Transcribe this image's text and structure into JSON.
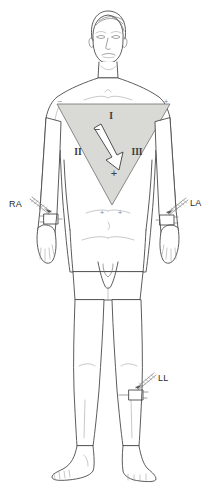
{
  "figure": {
    "background_color": "#ffffff"
  },
  "triangle": {
    "name": "Einthoven triangle",
    "fill_color": "#d9d9d6",
    "stroke_color": "#6e6e6e",
    "vertices": {
      "top_left": [
        57,
        104
      ],
      "top_right": [
        170,
        104
      ],
      "bottom_apex": [
        112,
        205
      ]
    },
    "leads": [
      {
        "id": "lead-i",
        "label": "I",
        "x": 111,
        "y": 116
      },
      {
        "id": "lead-ii",
        "label": "II",
        "x": 78,
        "y": 152
      },
      {
        "id": "lead-iii",
        "label": "III",
        "x": 137,
        "y": 152
      }
    ],
    "polarity_marks": [
      {
        "id": "lead-i-negative",
        "symbol": "−",
        "x": 97,
        "y": 129,
        "prominent": true
      },
      {
        "id": "lead-i-positive",
        "symbol": "+",
        "x": 114,
        "y": 173,
        "prominent": true
      },
      {
        "id": "shoulder-left-minus",
        "symbol": "−",
        "x": 58,
        "y": 103,
        "prominent": false
      },
      {
        "id": "shoulder-right-plus",
        "symbol": "+",
        "x": 166,
        "y": 102,
        "prominent": false
      },
      {
        "id": "apex-plus-left",
        "symbol": "+",
        "x": 102,
        "y": 212,
        "prominent": false
      },
      {
        "id": "apex-plus-right",
        "symbol": "+",
        "x": 120,
        "y": 212,
        "prominent": false
      }
    ]
  },
  "vector_arrow": {
    "name": "mean cardiac electrical axis arrow",
    "fill_color": "#ffffff",
    "stroke_color": "#3d3d3d",
    "from": [
      96,
      131
    ],
    "to": [
      116,
      168
    ],
    "direction": "down-right"
  },
  "electrodes": [
    {
      "id": "electrode-ra",
      "label": "RA",
      "full_name": "right arm",
      "label_x": 14,
      "label_y": 207,
      "site": "right wrist",
      "leader_from": [
        31,
        201
      ],
      "leader_to": [
        50,
        216
      ],
      "plate": {
        "x": 46,
        "y": 215,
        "w": 11,
        "h": 9
      }
    },
    {
      "id": "electrode-la",
      "label": "LA",
      "full_name": "left arm",
      "label_x": 191,
      "label_y": 206,
      "site": "left wrist",
      "leader_from": [
        188,
        201
      ],
      "leader_to": [
        168,
        217
      ],
      "plate": {
        "x": 161,
        "y": 216,
        "w": 11,
        "h": 9
      }
    },
    {
      "id": "electrode-ll",
      "label": "LL",
      "full_name": "left leg",
      "label_x": 159,
      "label_y": 381,
      "site": "left knee",
      "leader_from": [
        156,
        377
      ],
      "leader_to": [
        137,
        393
      ],
      "plate": {
        "x": 130,
        "y": 391,
        "w": 11,
        "h": 9
      }
    }
  ],
  "colors": {
    "outline": "#4a4a4a",
    "outline_thin": "#6e6e6e",
    "outline_faint": "#9a9a9a",
    "triangle_fill": "#d9d9d6",
    "label_text": "#2b2b2b"
  }
}
